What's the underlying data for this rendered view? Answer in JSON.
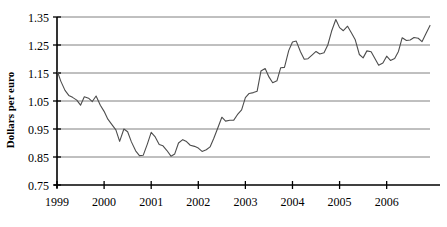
{
  "chart_data": {
    "type": "line",
    "title": "",
    "xlabel": "",
    "ylabel": "Dollars per euro",
    "ylim": [
      0.75,
      1.35
    ],
    "xlim": [
      1999.0,
      2006.92
    ],
    "ytick_labels": [
      "0.75",
      "0.85",
      "0.95",
      "1.05",
      "1.15",
      "1.25",
      "1.35"
    ],
    "ytick_values": [
      0.75,
      0.85,
      0.95,
      1.05,
      1.15,
      1.25,
      1.35
    ],
    "xtick_labels": [
      "1999",
      "2000",
      "2001",
      "2002",
      "2003",
      "2004",
      "2005",
      "2006"
    ],
    "xtick_values": [
      1999,
      2000,
      2001,
      2002,
      2003,
      2004,
      2005,
      2006
    ],
    "grid": "horizontal",
    "legend": "none",
    "line_color": "#4d4d4d",
    "axis_color": "#000000",
    "grid_color": "#808080",
    "series": [
      {
        "name": "Dollars per euro",
        "x": [
          1999.0,
          1999.08,
          1999.17,
          1999.25,
          1999.33,
          1999.42,
          1999.5,
          1999.58,
          1999.67,
          1999.75,
          1999.83,
          1999.92,
          2000.0,
          2000.08,
          2000.17,
          2000.25,
          2000.33,
          2000.42,
          2000.5,
          2000.58,
          2000.67,
          2000.75,
          2000.83,
          2000.92,
          2001.0,
          2001.08,
          2001.17,
          2001.25,
          2001.33,
          2001.42,
          2001.5,
          2001.58,
          2001.67,
          2001.75,
          2001.83,
          2001.92,
          2002.0,
          2002.08,
          2002.17,
          2002.25,
          2002.33,
          2002.42,
          2002.5,
          2002.58,
          2002.67,
          2002.75,
          2002.83,
          2002.92,
          2003.0,
          2003.08,
          2003.17,
          2003.25,
          2003.33,
          2003.42,
          2003.5,
          2003.58,
          2003.67,
          2003.75,
          2003.83,
          2003.92,
          2004.0,
          2004.08,
          2004.17,
          2004.25,
          2004.33,
          2004.42,
          2004.5,
          2004.58,
          2004.67,
          2004.75,
          2004.83,
          2004.92,
          2005.0,
          2005.08,
          2005.17,
          2005.25,
          2005.33,
          2005.42,
          2005.5,
          2005.58,
          2005.67,
          2005.75,
          2005.83,
          2005.92,
          2006.0,
          2006.08,
          2006.17,
          2006.25,
          2006.33,
          2006.42,
          2006.5,
          2006.58,
          2006.67,
          2006.75,
          2006.83,
          2006.92
        ],
        "values": [
          1.16,
          1.121,
          1.088,
          1.07,
          1.063,
          1.053,
          1.035,
          1.065,
          1.06,
          1.048,
          1.068,
          1.035,
          1.013,
          0.985,
          0.965,
          0.947,
          0.906,
          0.95,
          0.94,
          0.904,
          0.872,
          0.855,
          0.856,
          0.897,
          0.938,
          0.923,
          0.895,
          0.89,
          0.874,
          0.853,
          0.861,
          0.9,
          0.912,
          0.905,
          0.892,
          0.888,
          0.882,
          0.87,
          0.876,
          0.886,
          0.917,
          0.956,
          0.992,
          0.978,
          0.981,
          0.981,
          1.001,
          1.018,
          1.062,
          1.077,
          1.08,
          1.085,
          1.157,
          1.166,
          1.136,
          1.115,
          1.122,
          1.169,
          1.17,
          1.23,
          1.261,
          1.264,
          1.226,
          1.199,
          1.201,
          1.215,
          1.227,
          1.218,
          1.222,
          1.25,
          1.299,
          1.341,
          1.312,
          1.301,
          1.317,
          1.294,
          1.27,
          1.216,
          1.204,
          1.229,
          1.226,
          1.202,
          1.178,
          1.186,
          1.21,
          1.195,
          1.202,
          1.227,
          1.276,
          1.266,
          1.268,
          1.277,
          1.274,
          1.262,
          1.289,
          1.32
        ]
      }
    ]
  },
  "axis": {
    "y_title": "Dollars per euro"
  }
}
